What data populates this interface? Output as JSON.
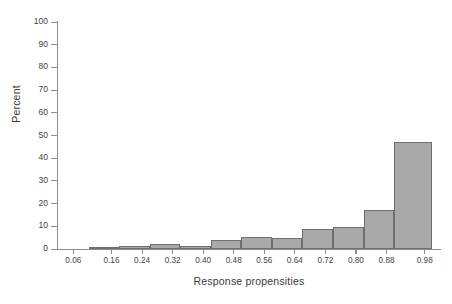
{
  "chart_data": {
    "type": "bar",
    "title": "",
    "subtitle": "",
    "xlabel": "Response propensities",
    "ylabel": "Percent",
    "categories": [
      "0.06",
      "0.16",
      "0.24",
      "0.32",
      "0.40",
      "0.48",
      "0.56",
      "0.64",
      "0.72",
      "0.80",
      "0.88",
      "0.98"
    ],
    "values": [
      0,
      0.8,
      1.2,
      2.4,
      1.5,
      4.0,
      5.4,
      4.8,
      8.8,
      9.6,
      17.2,
      47.1
    ],
    "series": [
      {
        "name": "Percent of cases",
        "values": [
          0,
          0.8,
          1.2,
          2.4,
          1.5,
          4.0,
          5.4,
          4.8,
          8.8,
          9.6,
          17.2,
          47.1
        ]
      }
    ],
    "xlim": [
      0.02,
      1.02
    ],
    "ylim": [
      0,
      100
    ],
    "ytick_labels": [
      "0",
      "10",
      "20",
      "30",
      "40",
      "50",
      "60",
      "70",
      "80",
      "90",
      "100"
    ],
    "ytick_values": [
      0,
      10,
      20,
      30,
      40,
      50,
      60,
      70,
      80,
      90,
      100
    ],
    "xtick_labels": [
      "0.06",
      "0.16",
      "0.24",
      "0.32",
      "0.40",
      "0.48",
      "0.56",
      "0.64",
      "0.72",
      "0.80",
      "0.88",
      "0.98"
    ],
    "xtick_values": [
      0.06,
      0.16,
      0.24,
      0.32,
      0.4,
      0.48,
      0.56,
      0.64,
      0.72,
      0.8,
      0.88,
      0.98
    ],
    "grid": false,
    "legend": null,
    "legend_position": "none",
    "annotations": [],
    "bar_fill_color": "#a9a9a9",
    "bar_edge_color": "#6f6f6f",
    "axis_color": "#8d8d8d",
    "text_color": "#3a3a3a",
    "background_color": "#ffffff",
    "bar_edges": [
      [
        0.04,
        0.1
      ],
      [
        0.1,
        0.18
      ],
      [
        0.18,
        0.26
      ],
      [
        0.26,
        0.34
      ],
      [
        0.34,
        0.42
      ],
      [
        0.42,
        0.5
      ],
      [
        0.5,
        0.58
      ],
      [
        0.58,
        0.66
      ],
      [
        0.66,
        0.74
      ],
      [
        0.74,
        0.82
      ],
      [
        0.82,
        0.9
      ],
      [
        0.9,
        1.0
      ]
    ]
  }
}
